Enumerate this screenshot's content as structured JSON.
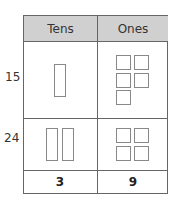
{
  "columns": {
    "tens": "Tens",
    "ones": "Ones"
  },
  "rows": [
    {
      "label": "15",
      "tens": 1,
      "ones": 5
    },
    {
      "label": "24",
      "tens": 2,
      "ones": 4
    }
  ],
  "totals": {
    "tens": "3",
    "ones": "9"
  },
  "colors": {
    "header_bg": "#d0d0d0",
    "border": "#666666",
    "block_stroke": "#888888"
  }
}
